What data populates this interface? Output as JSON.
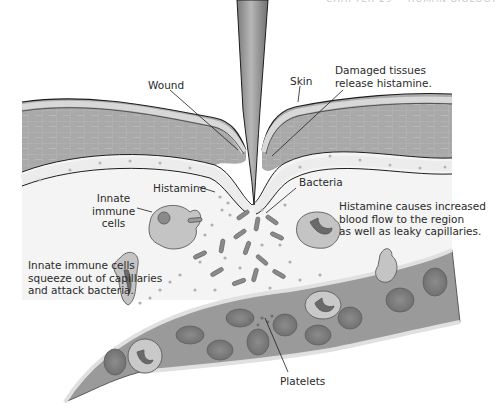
{
  "page": {
    "header_fragment": "CHAPTER 29    HUMAN BIOLOGY"
  },
  "figure": {
    "colors": {
      "skin_top": "#e6e6e6",
      "skin_band": "#cfcfcf",
      "dermis": "#a9a9a9",
      "cell_lines": "#bdbdbd",
      "basement_band": "#ececec",
      "interstitial": "#f2f2f2",
      "vessel_wall": "#8f8f8f",
      "vessel_lumen": "#9a9a9a",
      "rbc": "#7e7e7e",
      "bacteria": "#8a8a8a",
      "histamine": "#b0b0b0",
      "needle": "#9c9c9c",
      "outline": "#1e1e1e"
    },
    "labels": {
      "wound": "Wound",
      "skin": "Skin",
      "damaged_tissues": "Damaged tissues\nrelease histamine.",
      "histamine": "Histamine",
      "bacteria": "Bacteria",
      "innate_immune_cells": "Innate\nimmune\ncells",
      "histamine_effect": "Histamine causes increased\nblood flow to the region\nas well as leaky capillaries.",
      "immune_cells_action": "Innate immune cells\nsqueeze out of capillaries\nand attack bacteria.",
      "platelets": "Platelets"
    }
  }
}
